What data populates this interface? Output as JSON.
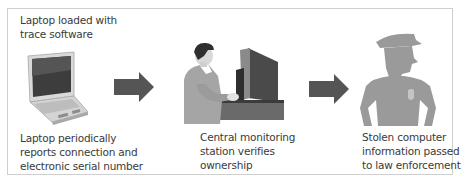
{
  "diagram": {
    "type": "process-flow",
    "steps": [
      {
        "id": "laptop",
        "icon": "laptop-icon",
        "caption_top": "Laptop loaded with\ntrace software",
        "caption_bottom": "Laptop periodically\nreports connection and\nelectronic serial number"
      },
      {
        "id": "monitoring",
        "icon": "monitoring-operator-icon",
        "caption_bottom": "Central monitoring\nstation verifies\nownership"
      },
      {
        "id": "police",
        "icon": "police-officer-icon",
        "caption_bottom": "Stolen computer\ninformation passed\nto law enforcement"
      }
    ],
    "arrows": [
      {
        "from": "laptop",
        "to": "monitoring",
        "icon": "arrow-right-icon"
      },
      {
        "from": "monitoring",
        "to": "police",
        "icon": "arrow-right-icon"
      }
    ],
    "colors": {
      "border": "#cfcfcf",
      "text": "#3a3a3a",
      "arrow": "#555555",
      "silhouette": "#9a9a9a"
    }
  }
}
